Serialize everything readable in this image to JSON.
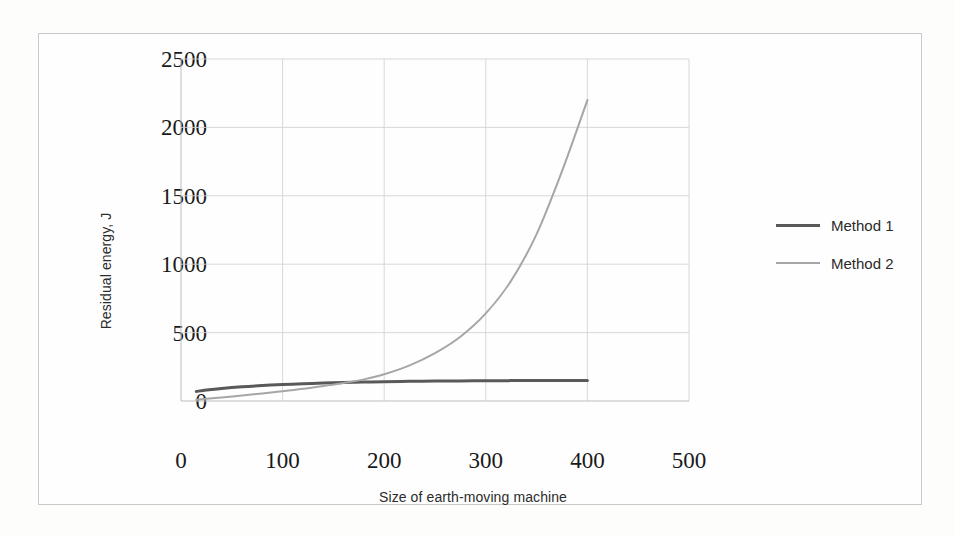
{
  "chart_data": {
    "type": "line",
    "title": "",
    "xlabel": "Size of earth-moving machine",
    "ylabel": "Residual energy, J",
    "xlim": [
      0,
      500
    ],
    "ylim": [
      0,
      2500
    ],
    "xticks": [
      "0",
      "100",
      "200",
      "300",
      "400",
      "500"
    ],
    "yticks": [
      "0",
      "500",
      "1000",
      "1500",
      "2000",
      "2500"
    ],
    "grid": "both",
    "legend_position": "right",
    "series": [
      {
        "name": "Method 1",
        "color": "#595959",
        "x": [
          15,
          25,
          40,
          60,
          80,
          100,
          120,
          140,
          160,
          180,
          200,
          225,
          250,
          275,
          300,
          325,
          350,
          375,
          400
        ],
        "values": [
          70,
          80,
          92,
          104,
          113,
          120,
          126,
          131,
          135,
          138,
          141,
          144,
          146,
          147,
          148,
          149,
          150,
          150,
          150
        ]
      },
      {
        "name": "Method 2",
        "color": "#a6a6a6",
        "x": [
          15,
          25,
          40,
          60,
          80,
          100,
          120,
          140,
          160,
          180,
          200,
          225,
          250,
          275,
          300,
          325,
          350,
          375,
          400
        ],
        "values": [
          10,
          16,
          26,
          40,
          55,
          71,
          89,
          110,
          132,
          158,
          195,
          260,
          350,
          470,
          640,
          880,
          1220,
          1680,
          2200
        ]
      }
    ]
  },
  "legend": {
    "items": [
      {
        "label": "Method 1",
        "color": "#595959"
      },
      {
        "label": "Method 2",
        "color": "#a6a6a6"
      }
    ]
  },
  "axes": {
    "y_title": "Residual energy, J",
    "x_title": "Size of earth-moving machine"
  }
}
